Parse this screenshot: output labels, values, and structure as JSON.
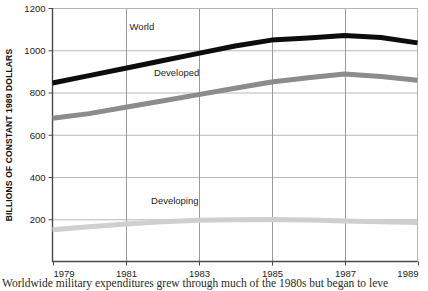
{
  "figure": {
    "ylabel_text": "BILLIONS OF CONSTANT 1989 DOLLARS",
    "caption": "Worldwide military expenditures grew through much of the 1980s but began to leve"
  },
  "chart_data": {
    "type": "line",
    "title": "",
    "xlabel": "",
    "ylabel": "BILLIONS OF CONSTANT 1989 DOLLARS",
    "x": [
      1979,
      1980,
      1981,
      1982,
      1983,
      1984,
      1985,
      1986,
      1987,
      1988,
      1989
    ],
    "xtick_labels": [
      "1979",
      "1981",
      "1983",
      "1985",
      "1987",
      "1989"
    ],
    "xticks": [
      1979,
      1981,
      1983,
      1985,
      1987,
      1989
    ],
    "ytick_labels": [
      "200",
      "400",
      "600",
      "800",
      "1000",
      "1200"
    ],
    "yticks": [
      200,
      400,
      600,
      800,
      1000,
      1200
    ],
    "xlim": [
      1979,
      1989
    ],
    "ylim": [
      0,
      1200
    ],
    "grid": true,
    "legend_position": "inline-labels",
    "series": [
      {
        "name": "World",
        "color": "#0d0d0d",
        "width": 5.0,
        "label_x": 1981.45,
        "label_y": 1095,
        "values": [
          845,
          880,
          915,
          950,
          985,
          1020,
          1048,
          1058,
          1070,
          1060,
          1035
        ]
      },
      {
        "name": "Developed",
        "color": "#8c8c8c",
        "width": 5.0,
        "label_x": 1982.4,
        "label_y": 880,
        "values": [
          678,
          700,
          730,
          760,
          790,
          820,
          850,
          870,
          888,
          876,
          858
        ]
      },
      {
        "name": "Developing",
        "color": "#cfcfcf",
        "width": 5.0,
        "label_x": 1982.35,
        "label_y": 272,
        "values": [
          150,
          165,
          178,
          188,
          195,
          198,
          199,
          196,
          192,
          188,
          185
        ]
      }
    ]
  }
}
